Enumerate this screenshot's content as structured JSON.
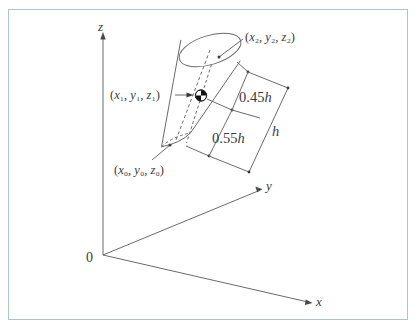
{
  "figure": {
    "background_color": "#ffffff",
    "frame_color": "#a9c4d4",
    "line_color": "#6b6b6b",
    "text_color": "#3a3a3a"
  },
  "axes": {
    "origin_label": "0",
    "z_label": "z",
    "y_label": "y",
    "x_label": "x"
  },
  "labels": {
    "top_point": "(x₂, y₂, z₂)",
    "centroid_point": "(x₁, y₁, z₁)",
    "bottom_point": "(x₀, y₀, z₀)"
  },
  "dimensions": {
    "upper": "0.45h",
    "lower": "0.55h",
    "total": "h"
  },
  "chart_data": {
    "type": "diagram",
    "object": "cylinder",
    "annotations": [
      {
        "name": "top-center-point",
        "label": "(x₂, y₂, z₂)"
      },
      {
        "name": "centroid-point",
        "label": "(x₁, y₁, z₁)"
      },
      {
        "name": "bottom-center-point",
        "label": "(x₀, y₀, z₀)"
      },
      {
        "name": "upper-segment",
        "label": "0.45h"
      },
      {
        "name": "lower-segment",
        "label": "0.55h"
      },
      {
        "name": "total-height",
        "label": "h"
      }
    ],
    "axis_labels": [
      "x",
      "y",
      "z"
    ],
    "origin": "0"
  }
}
